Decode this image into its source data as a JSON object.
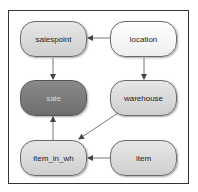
{
  "diagram": {
    "nodes": [
      {
        "id": "salespoint",
        "label": "salespoint",
        "style": "light-gray"
      },
      {
        "id": "location",
        "label": "location",
        "style": "white"
      },
      {
        "id": "sale",
        "label": "sale",
        "style": "dark-gray"
      },
      {
        "id": "warehouse",
        "label": "warehouse",
        "style": "light-gray"
      },
      {
        "id": "item_in_wh",
        "label": "item_in_wh",
        "style": "light-gray"
      },
      {
        "id": "item",
        "label": "item",
        "style": "light-gray"
      }
    ],
    "edges": [
      {
        "from": "location",
        "to": "salespoint"
      },
      {
        "from": "location",
        "to": "warehouse"
      },
      {
        "from": "salespoint",
        "to": "sale"
      },
      {
        "from": "warehouse",
        "to": "item_in_wh"
      },
      {
        "from": "item",
        "to": "item_in_wh"
      },
      {
        "from": "item_in_wh",
        "to": "sale"
      }
    ],
    "colors": {
      "frame": "#333333",
      "edge": "#555555",
      "light_node": "#d9d9d9",
      "white_node": "#f7f7f7",
      "dark_node": "#7c7c7c"
    }
  }
}
